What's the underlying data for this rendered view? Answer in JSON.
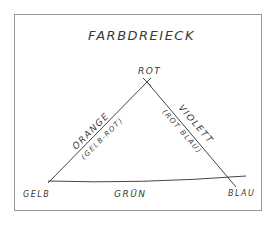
{
  "diagram": {
    "title": "FARBDREIECK",
    "vertices": {
      "top": "ROT",
      "bottom_left": "GELB",
      "bottom_right": "BLAU"
    },
    "edges": {
      "left": {
        "label": "ORANGE",
        "sublabel": "(GELB-ROT)"
      },
      "right": {
        "label": "VIOLETT",
        "sublabel": "(ROT BLAU)"
      },
      "bottom": {
        "label": "GRÜN"
      }
    },
    "colors": {
      "ink": "#3a3a3a",
      "border": "#9a9a9a",
      "background": "#ffffff"
    }
  }
}
